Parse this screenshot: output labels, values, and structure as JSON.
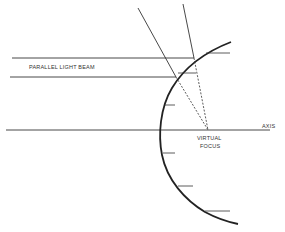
{
  "diagram": {
    "labels": {
      "beam": "PARALLEL LIGHT BEAM",
      "axis": "AXIS",
      "focus_line1": "VIRTUAL",
      "focus_line2": "FOCUS"
    },
    "elements": {
      "mirror": "convex mirror surface (curved)",
      "axis": "principal axis",
      "rays": [
        "incoming parallel ray upper",
        "incoming parallel ray lower"
      ],
      "reflected_rays": [
        "reflected ray upper",
        "reflected ray lower"
      ],
      "virtual_rays": [
        "dashed extension upper",
        "dashed extension lower"
      ],
      "normals_ticks": 6
    },
    "colors": {
      "line": "#333333",
      "background": "#ffffff"
    }
  }
}
